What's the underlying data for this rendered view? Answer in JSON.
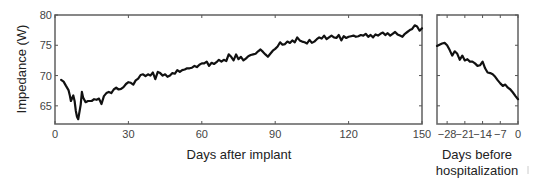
{
  "chart_data": [
    {
      "type": "line",
      "title": "",
      "xlabel": "Days after implant",
      "ylabel": "Impedance (W)",
      "xlim": [
        0,
        150
      ],
      "ylim": [
        62,
        80
      ],
      "xticks": [
        0,
        30,
        60,
        90,
        120,
        150
      ],
      "yticks": [
        65,
        70,
        75,
        80
      ],
      "grid": false,
      "legend": null,
      "series": [
        {
          "name": "Impedance",
          "x": [
            2.5,
            3.5,
            4.5,
            5.5,
            6,
            6.5,
            7.5,
            8,
            8.5,
            9,
            9.5,
            10.5,
            11,
            11.5,
            12.5,
            13.5,
            15,
            16,
            17,
            18,
            19,
            20,
            21,
            22,
            23,
            24,
            25,
            26,
            27,
            28,
            29,
            30,
            31,
            32,
            33,
            34,
            35,
            36,
            37,
            38,
            39,
            40,
            41,
            42,
            43,
            44,
            45,
            46,
            47,
            48,
            49,
            50,
            51,
            52,
            53,
            54,
            55,
            56,
            57,
            58,
            59,
            60,
            61,
            62,
            63,
            64,
            65,
            66,
            67,
            68,
            69,
            70,
            71,
            72,
            73,
            74,
            75,
            76,
            77,
            78,
            79,
            80,
            81,
            82,
            83,
            84,
            85,
            86,
            87,
            88,
            89,
            90,
            91,
            92,
            93,
            94,
            95,
            96,
            97,
            98,
            99,
            100,
            101,
            102,
            103,
            104,
            105,
            106,
            107,
            108,
            109,
            110,
            111,
            112,
            113,
            114,
            115,
            116,
            117,
            118,
            119,
            120,
            121,
            122,
            123,
            124,
            125,
            126,
            127,
            128,
            129,
            130,
            131,
            132,
            133,
            134,
            135,
            136,
            137,
            138,
            139,
            140,
            141,
            142,
            143,
            144,
            145,
            146,
            147,
            148,
            149,
            150
          ],
          "y": [
            69.3,
            69.0,
            68.3,
            67.6,
            66.8,
            65.8,
            66.7,
            65.8,
            64.2,
            63.2,
            62.8,
            65.2,
            67.3,
            66.4,
            65.6,
            65.8,
            65.8,
            66.1,
            66.0,
            66.2,
            65.3,
            66.6,
            67.1,
            67.3,
            67.1,
            67.7,
            68.0,
            67.7,
            67.8,
            68.1,
            68.6,
            68.9,
            68.8,
            68.5,
            69.2,
            69.5,
            70.1,
            70.2,
            69.9,
            70.2,
            70.0,
            70.5,
            69.4,
            70.6,
            70.4,
            70.0,
            70.2,
            69.8,
            70.0,
            70.4,
            70.3,
            70.9,
            70.6,
            70.9,
            71.0,
            71.2,
            71.2,
            71.3,
            71.6,
            71.4,
            71.8,
            72.0,
            72.0,
            72.3,
            71.6,
            72.1,
            71.9,
            72.2,
            72.6,
            72.3,
            72.6,
            72.4,
            73.5,
            73.1,
            72.5,
            73.5,
            72.7,
            73.1,
            72.5,
            72.8,
            73.2,
            73.4,
            73.5,
            73.6,
            74.0,
            74.3,
            73.9,
            73.5,
            73.1,
            73.6,
            74.1,
            74.4,
            74.8,
            75.5,
            75.1,
            75.2,
            75.6,
            75.4,
            75.8,
            75.5,
            76.3,
            75.8,
            75.6,
            75.5,
            75.3,
            75.9,
            75.4,
            75.6,
            76.0,
            76.3,
            76.1,
            76.6,
            76.0,
            76.3,
            76.6,
            76.3,
            76.2,
            76.7,
            75.8,
            76.5,
            76.2,
            76.4,
            76.5,
            76.6,
            76.4,
            76.5,
            76.7,
            76.6,
            76.9,
            76.4,
            76.7,
            76.3,
            76.8,
            76.6,
            76.9,
            77.1,
            76.7,
            77.0,
            76.6,
            76.9,
            77.2,
            76.8,
            76.6,
            76.4,
            76.9,
            77.2,
            77.5,
            77.7,
            78.3,
            78.1,
            77.4,
            77.8,
            78.1,
            77.6,
            77.0,
            76.1,
            77.3,
            77.2,
            77.0,
            77.4,
            77.0,
            77.3,
            77.6,
            77.4,
            77.2,
            77.4
          ]
        }
      ]
    },
    {
      "type": "line",
      "title": "",
      "xlabel": "Days before hospitalization",
      "ylabel": "",
      "xlim": [
        -32,
        0
      ],
      "ylim": [
        62,
        80
      ],
      "xticks": [
        -28,
        -21,
        -14,
        -7,
        0
      ],
      "yticks": [
        65,
        70,
        75,
        80
      ],
      "grid": false,
      "legend": null,
      "series": [
        {
          "name": "Impedance",
          "x": [
            -32,
            -31,
            -30,
            -29,
            -28,
            -27,
            -26,
            -25,
            -24,
            -23,
            -22,
            -21,
            -20,
            -19,
            -18,
            -17,
            -16,
            -15,
            -14,
            -13,
            -12,
            -11,
            -10,
            -9,
            -8,
            -7,
            -6,
            -5,
            -4,
            -3,
            -2,
            -1,
            0
          ],
          "y": [
            74.9,
            75.1,
            75.3,
            75.4,
            75.0,
            74.2,
            73.3,
            74.0,
            73.6,
            72.6,
            73.3,
            72.5,
            72.7,
            72.3,
            72.3,
            72.0,
            71.6,
            71.7,
            72.3,
            71.2,
            70.5,
            70.4,
            70.2,
            69.8,
            69.2,
            68.7,
            68.3,
            68.5,
            68.0,
            67.7,
            67.2,
            66.6,
            66.1
          ]
        }
      ]
    }
  ],
  "panels": {
    "main": {
      "ylabel": "Impedance (W)",
      "xlabel": "Days after implant",
      "xtick_labels": [
        "0",
        "30",
        "60",
        "90",
        "120",
        "150"
      ],
      "ytick_labels": [
        "65",
        "70",
        "75",
        "80"
      ]
    },
    "secondary": {
      "xlabel_line1": "Days before",
      "xlabel_line2": "hospitalization",
      "xtick_labels": [
        "−28",
        "−21",
        "−14",
        "−7",
        "0"
      ]
    }
  }
}
